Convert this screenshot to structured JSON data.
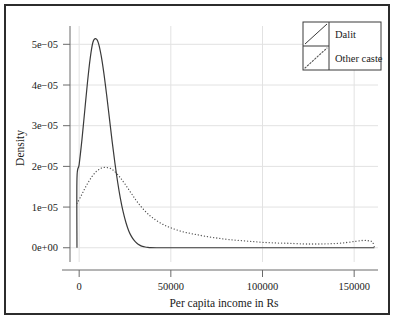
{
  "chart_data": {
    "type": "line",
    "title": "",
    "xlabel": "Per capita income in Rs",
    "ylabel": "Density",
    "xlim": [
      -5000,
      163000
    ],
    "ylim": [
      -3.5e-06,
      5.45e-05
    ],
    "grid": true,
    "legend_position": "top-right",
    "xticks": [
      0,
      50000,
      100000,
      150000
    ],
    "xtick_labels": [
      "0",
      "50000",
      "100000",
      "150000"
    ],
    "yticks": [
      0.0,
      1e-05,
      2e-05,
      3e-05,
      4e-05,
      5e-05
    ],
    "ytick_labels": [
      "0e+00",
      "1e-05",
      "2e-05",
      "3e-05",
      "4e-05",
      "5e-05"
    ],
    "series": [
      {
        "name": "Dalit",
        "style": "solid",
        "color": "#3a3a3a",
        "x": [
          -1200,
          -1200,
          0,
          1500,
          3000,
          4500,
          6000,
          7500,
          9000,
          10500,
          12000,
          13500,
          15000,
          16500,
          18000,
          19500,
          21000,
          22500,
          24000,
          25500,
          27000,
          28500,
          30000,
          31500,
          33000,
          34500,
          36000,
          37500,
          39000,
          42000,
          48000,
          60000,
          80000,
          100000,
          120000,
          140000,
          161000
        ],
        "y": [
          0.0,
          1.71e-05,
          2.05e-05,
          2.65e-05,
          3.35e-05,
          4.05e-05,
          4.65e-05,
          5.05e-05,
          5.14e-05,
          5.03e-05,
          4.72e-05,
          4.28e-05,
          3.75e-05,
          3.18e-05,
          2.61e-05,
          2.08e-05,
          1.61e-05,
          1.21e-05,
          8.8e-06,
          6.2e-06,
          4.2e-06,
          2.8e-06,
          1.8e-06,
          1.1e-06,
          6.5e-07,
          3.5e-07,
          1.8e-07,
          8e-08,
          3e-08,
          0.0,
          0.0,
          0.0,
          0.0,
          0.0,
          0.0,
          0.0,
          0.0
        ]
      },
      {
        "name": "Other caste",
        "style": "dotted",
        "color": "#555555",
        "x": [
          -1200,
          1000,
          3000,
          5000,
          7000,
          9000,
          11000,
          13000,
          15000,
          17000,
          19000,
          21000,
          23000,
          26000,
          29000,
          32000,
          36000,
          40000,
          45000,
          50000,
          56000,
          62000,
          68000,
          75000,
          82000,
          90000,
          98000,
          106000,
          114000,
          122000,
          128000,
          134000,
          140000,
          146000,
          151000,
          155000,
          158000,
          160000,
          161000
        ],
        "y": [
          1.09e-05,
          1.27e-05,
          1.45e-05,
          1.61e-05,
          1.75e-05,
          1.86e-05,
          1.93e-05,
          1.97e-05,
          1.97e-05,
          1.95e-05,
          1.89e-05,
          1.8e-05,
          1.69e-05,
          1.5e-05,
          1.3e-05,
          1.11e-05,
          9e-06,
          7.4e-06,
          5.9e-06,
          4.9e-06,
          4e-06,
          3.4e-06,
          2.9e-06,
          2.4e-06,
          2e-06,
          1.7e-06,
          1.4e-06,
          1.2e-06,
          1.1e-06,
          9.5e-07,
          9.2e-07,
          9.5e-07,
          1.05e-06,
          1.3e-06,
          1.6e-06,
          1.8e-06,
          1.7e-06,
          1.4e-06,
          2e-07
        ]
      }
    ],
    "legend": [
      {
        "label": "Dalit",
        "style": "solid"
      },
      {
        "label": "Other caste",
        "style": "dotted"
      }
    ]
  },
  "axes": {
    "y_title": "Density",
    "x_title": "Per capita income in Rs"
  }
}
